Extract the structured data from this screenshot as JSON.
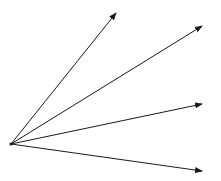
{
  "diagram": {
    "width": 221,
    "height": 181,
    "background": "#ffffff",
    "stroke_color": "#1a1a1a",
    "stroke_width": 1,
    "origin": {
      "x": 11,
      "y": 144
    },
    "vectors": [
      {
        "id": "vector-1",
        "to": {
          "x": 116,
          "y": 13
        }
      },
      {
        "id": "vector-2",
        "to": {
          "x": 202,
          "y": 26
        }
      },
      {
        "id": "vector-3",
        "to": {
          "x": 202,
          "y": 104
        }
      },
      {
        "id": "vector-4",
        "to": {
          "x": 202,
          "y": 171
        }
      }
    ]
  }
}
